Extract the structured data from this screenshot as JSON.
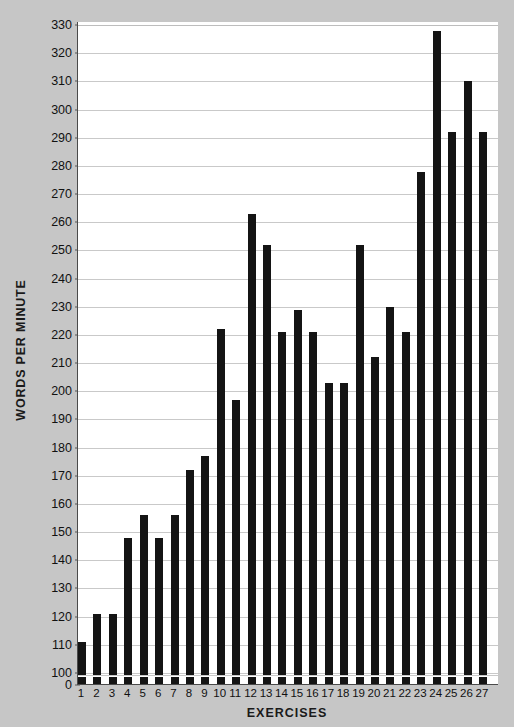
{
  "chart_data": {
    "type": "bar",
    "title": "",
    "xlabel": "EXERCISES",
    "ylabel": "WORDS PER MINUTE",
    "categories": [
      "1",
      "2",
      "3",
      "4",
      "5",
      "6",
      "7",
      "8",
      "9",
      "10",
      "11",
      "12",
      "13",
      "14",
      "15",
      "16",
      "17",
      "18",
      "19",
      "20",
      "21",
      "22",
      "23",
      "24",
      "25",
      "26",
      "27"
    ],
    "values": [
      111,
      121,
      121,
      148,
      156,
      148,
      156,
      172,
      177,
      222,
      197,
      263,
      252,
      221,
      229,
      221,
      203,
      203,
      252,
      212,
      230,
      221,
      278,
      328,
      292,
      310,
      292
    ],
    "ylim": [
      100,
      330
    ],
    "y_axis_broken_at_zero": true,
    "yticks": [
      330,
      320,
      310,
      300,
      290,
      280,
      270,
      260,
      250,
      240,
      230,
      220,
      210,
      200,
      190,
      180,
      170,
      160,
      150,
      140,
      130,
      120,
      110,
      100,
      0
    ],
    "grid": true,
    "legend": "none",
    "colors": {
      "bar": "#141414",
      "plot_background": "#ffffff",
      "page_background": "#c6c6c6",
      "gridline": "#c9c9c9",
      "axis": "#4a4a4a",
      "text": "#111111"
    }
  }
}
